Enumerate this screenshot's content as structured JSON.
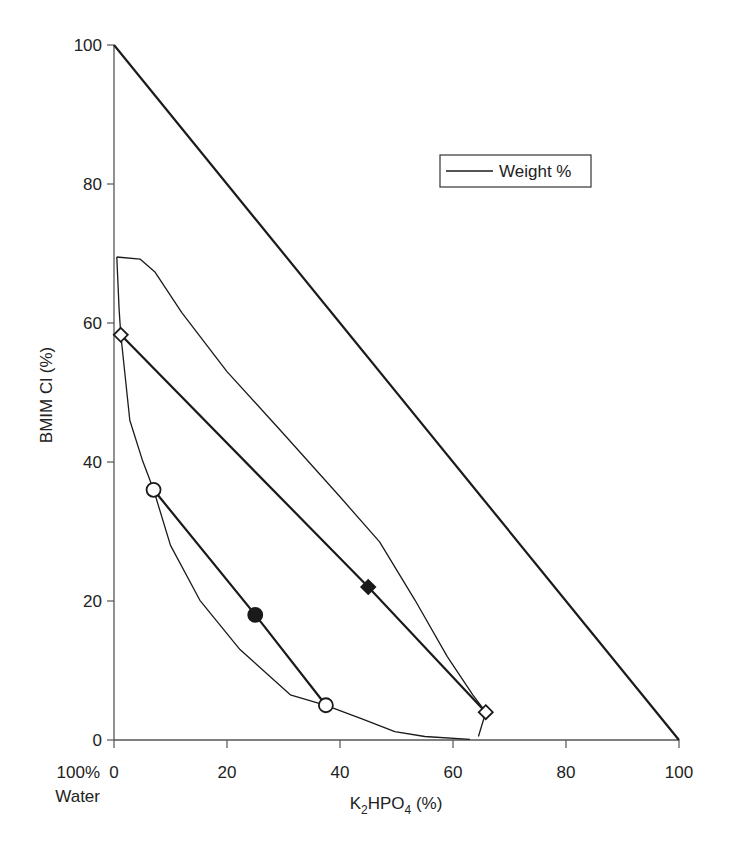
{
  "chart_data": {
    "type": "line",
    "title": "",
    "xlabel": "K2HPO4 (%)",
    "xlabel_parts": {
      "pre": "K",
      "sub1": "2",
      "mid": "HPO",
      "sub2": "4",
      "post": " (%)"
    },
    "ylabel": "BMIM Cl (%)",
    "origin_label_line1": "100%",
    "origin_label_line2": "Water",
    "xlim": [
      0,
      100
    ],
    "ylim": [
      0,
      100
    ],
    "x_ticks": [
      0,
      20,
      40,
      60,
      80,
      100
    ],
    "y_ticks": [
      0,
      20,
      40,
      60,
      80,
      100
    ],
    "grid": false,
    "legend": {
      "position": "upper-right",
      "entries": [
        "Weight %"
      ]
    },
    "series": [
      {
        "name": "Triangle boundary (100% line)",
        "style": "thick",
        "points": [
          [
            0,
            100
          ],
          [
            100,
            0
          ]
        ]
      },
      {
        "name": "Binodal curve",
        "style": "thin",
        "points": [
          [
            0.5,
            69.5
          ],
          [
            4.6,
            69.2
          ],
          [
            7.3,
            67.3
          ],
          [
            12,
            61.5
          ],
          [
            20,
            53
          ],
          [
            29.4,
            44.6
          ],
          [
            40,
            35
          ],
          [
            47,
            28.5
          ],
          [
            53.3,
            20.1
          ],
          [
            59,
            12
          ],
          [
            63.5,
            6.5
          ],
          [
            65.8,
            4.0
          ],
          [
            64.5,
            0.5
          ]
        ]
      },
      {
        "name": "Binodal curve (inner branch)",
        "style": "thin",
        "points": [
          [
            0.5,
            69.5
          ],
          [
            0.9,
            62
          ],
          [
            1.2,
            58.3
          ],
          [
            2.8,
            46
          ],
          [
            5,
            40.3
          ],
          [
            7,
            36
          ],
          [
            10,
            28
          ],
          [
            15.2,
            20.1
          ],
          [
            22.3,
            13
          ],
          [
            31.2,
            6.5
          ],
          [
            37.5,
            5.0
          ],
          [
            44,
            3
          ],
          [
            49.7,
            1.2
          ],
          [
            55,
            0.5
          ],
          [
            63,
            0.1
          ]
        ]
      },
      {
        "name": "Tie line 1",
        "style": "thick",
        "points": [
          [
            1.2,
            58.3
          ],
          [
            45,
            22
          ],
          [
            65.8,
            4.0
          ]
        ],
        "markers": [
          {
            "x": 1.2,
            "y": 58.3,
            "shape": "diamond",
            "filled": false
          },
          {
            "x": 45,
            "y": 22,
            "shape": "diamond",
            "filled": true
          },
          {
            "x": 65.8,
            "y": 4.0,
            "shape": "diamond",
            "filled": false
          }
        ]
      },
      {
        "name": "Tie line 2",
        "style": "thick",
        "points": [
          [
            7,
            36
          ],
          [
            25,
            18
          ],
          [
            37.5,
            5.0
          ]
        ],
        "markers": [
          {
            "x": 7,
            "y": 36,
            "shape": "circle",
            "filled": false
          },
          {
            "x": 25,
            "y": 18,
            "shape": "circle",
            "filled": true
          },
          {
            "x": 37.5,
            "y": 5.0,
            "shape": "circle",
            "filled": false
          }
        ]
      }
    ]
  },
  "colors": {
    "line": "#1a1a1a",
    "axis": "#555555",
    "background": "#ffffff"
  }
}
